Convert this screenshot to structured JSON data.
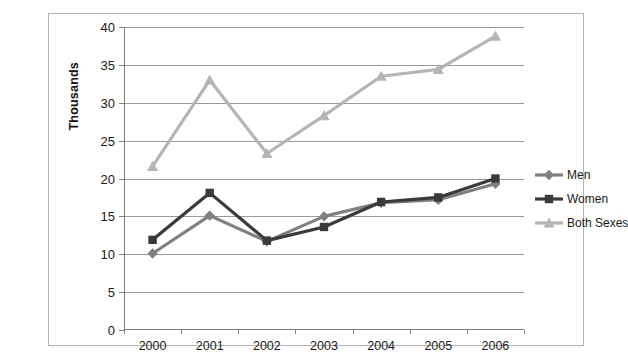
{
  "scan": {
    "top_strip_text": ""
  },
  "chart_data": {
    "type": "line",
    "title": "",
    "xlabel": "",
    "ylabel": "Thousands",
    "categories": [
      "2000",
      "2001",
      "2002",
      "2003",
      "2004",
      "2005",
      "2006"
    ],
    "ylim": [
      0,
      40
    ],
    "yticks": [
      0,
      5,
      10,
      15,
      20,
      25,
      30,
      35,
      40
    ],
    "ytick_labels": [
      "0",
      "5",
      "10",
      "15",
      "20",
      "25",
      "30",
      "35",
      "40"
    ],
    "grid": true,
    "legend_position": "right",
    "series": [
      {
        "name": "Men",
        "color": "#808080",
        "marker": "diamond",
        "values": [
          10.1,
          15.1,
          11.7,
          15.0,
          16.8,
          17.2,
          19.3
        ]
      },
      {
        "name": "Women",
        "color": "#3a3a3a",
        "marker": "square",
        "values": [
          11.9,
          18.1,
          11.8,
          13.6,
          16.9,
          17.5,
          20.0
        ]
      },
      {
        "name": "Both Sexes",
        "color": "#b5b5b5",
        "marker": "triangle",
        "values": [
          21.6,
          33.0,
          23.3,
          28.3,
          33.5,
          34.4,
          38.8
        ]
      }
    ]
  },
  "legend": {
    "items": [
      {
        "label": "Men"
      },
      {
        "label": "Women"
      },
      {
        "label": "Both Sexes"
      }
    ]
  }
}
